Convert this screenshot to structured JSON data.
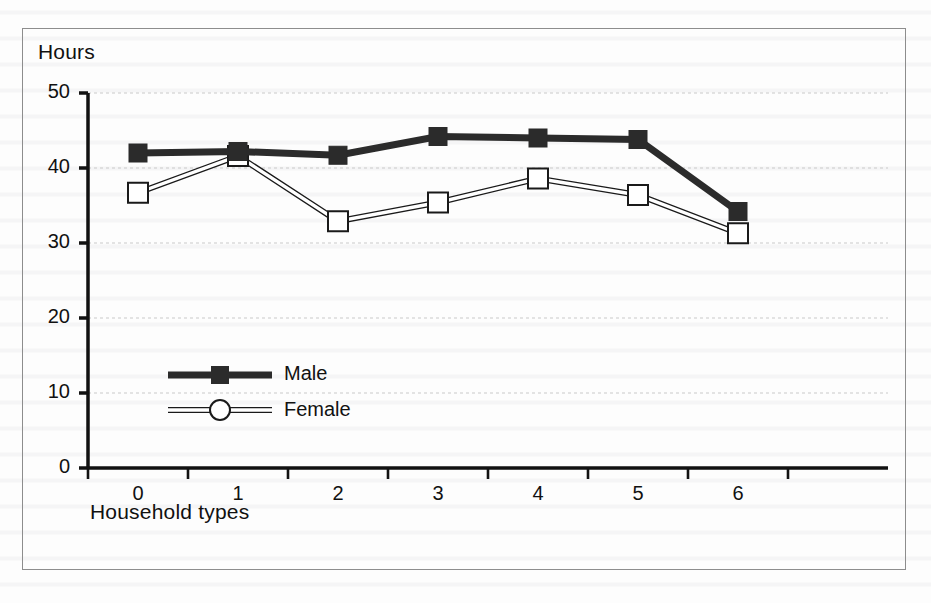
{
  "chart_data": {
    "type": "line",
    "title": "",
    "subtitle": "",
    "xlabel": "Household types",
    "ylabel": "Hours",
    "categories": [
      "0",
      "1",
      "2",
      "3",
      "4",
      "5",
      "6"
    ],
    "series": [
      {
        "name": "Male",
        "marker": "filled-square",
        "color": "#2b2b2b",
        "line_width": 7,
        "values": [
          42.0,
          42.2,
          41.7,
          44.2,
          44.0,
          43.8,
          34.2
        ]
      },
      {
        "name": "Female",
        "marker": "open-square",
        "color": "#1a1a1a",
        "line_width": 1,
        "values": [
          36.7,
          41.6,
          32.9,
          35.4,
          38.6,
          36.4,
          31.3
        ]
      }
    ],
    "ylim": [
      0,
      50
    ],
    "yticks": [
      0,
      10,
      20,
      30,
      40,
      50
    ],
    "ytick_labels": [
      "0",
      "10",
      "20",
      "30",
      "40",
      "50"
    ],
    "grid": true,
    "grid_style": "dotted",
    "legend_position": "inside-lower-left",
    "legend_entries": [
      {
        "label": "Male",
        "marker": "filled-square"
      },
      {
        "label": "Female",
        "marker": "open-circle"
      }
    ]
  },
  "axes": {
    "y_title": "Hours",
    "x_title": "Household types"
  },
  "legend": {
    "male_label": "Male",
    "female_label": "Female"
  }
}
